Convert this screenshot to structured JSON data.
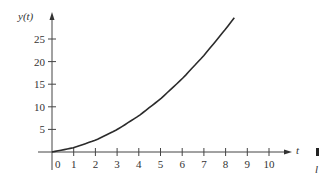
{
  "chart_data": {
    "type": "line",
    "title": "",
    "xlabel": "t",
    "ylabel": "y(t)",
    "xlim": [
      -1,
      11
    ],
    "ylim": [
      -1,
      30
    ],
    "grid": false,
    "x_ticks": [
      0,
      1,
      2,
      3,
      4,
      5,
      6,
      7,
      8,
      9,
      10
    ],
    "y_ticks": [
      5,
      10,
      15,
      20,
      25
    ],
    "series": [
      {
        "name": "y(t)",
        "x": [
          0,
          1,
          2,
          3,
          4,
          5,
          6,
          7,
          8,
          8.4
        ],
        "values": [
          0,
          0.95,
          2.6,
          4.95,
          8.0,
          11.75,
          16.2,
          21.35,
          27.2,
          29.7
        ]
      }
    ],
    "annotations": [
      "l"
    ]
  },
  "labels": {
    "ylabel": "y(t)",
    "xlabel": "t",
    "corner_note": "l"
  }
}
